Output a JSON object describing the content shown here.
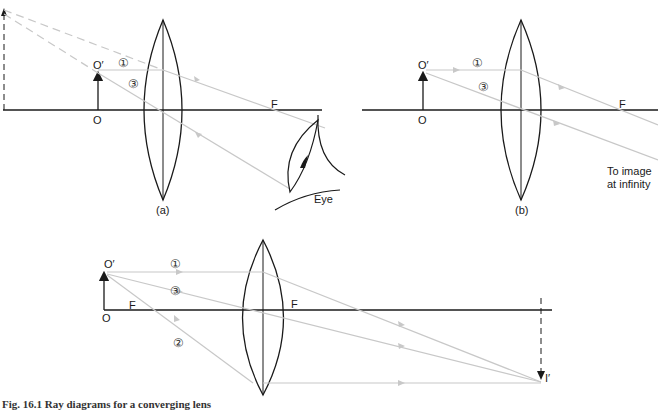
{
  "diagram": {
    "title": "Ray diagrams for a converging lens",
    "colors": {
      "lines": "#1a1a1a",
      "rays": "#c8c8c8",
      "background": "#ffffff"
    },
    "panels": [
      {
        "id": "a",
        "label": "(a)",
        "object_top": "O′",
        "object_base": "O",
        "focal_point": "F",
        "ray_labels": [
          "①",
          "③"
        ],
        "eye_label": "Eye"
      },
      {
        "id": "b",
        "label": "(b)",
        "object_top": "O′",
        "object_base": "O",
        "focal_point": "F",
        "ray_labels": [
          "①",
          "③"
        ],
        "note_line1": "To image",
        "note_line2": "at infinity"
      },
      {
        "id": "c",
        "object_top": "O′",
        "object_base": "O",
        "focal_point_left": "F",
        "focal_point_right": "F",
        "ray_labels": [
          "①",
          "③",
          "②"
        ],
        "image_label": "I′"
      }
    ],
    "caption": "Fig. 16.1 Ray diagrams for a converging lens"
  }
}
